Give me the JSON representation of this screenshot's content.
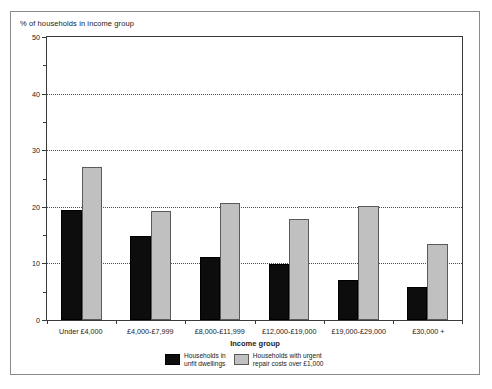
{
  "figure": {
    "title": "% of households in income group",
    "axis_title_x": "Income group"
  },
  "chart_data": {
    "type": "bar",
    "title": "% of households in income group",
    "xlabel": "Income group",
    "ylabel": "",
    "ylim": [
      0,
      50
    ],
    "yticks": [
      0,
      10,
      20,
      30,
      40,
      50
    ],
    "ytick_labels": [
      "0",
      "10",
      "20",
      "30",
      "40",
      "50"
    ],
    "yminor_ticks": [
      5,
      15,
      25,
      35,
      45
    ],
    "grid": "horizontal-dotted",
    "legend_position": "bottom",
    "categories": [
      "Under £4,000",
      "£4,000-£7,999",
      "£8,000-£11,999",
      "£12,000-£19,000",
      "£19,000-£29,000",
      "£30,000 +"
    ],
    "series": [
      {
        "name": "Households in\nunfit dwellings",
        "color": "#0d0d0d",
        "values": [
          19.4,
          14.8,
          11.2,
          9.9,
          7.1,
          5.9
        ]
      },
      {
        "name": "Households with urgent\nrepair costs over £1,000",
        "color": "#c0c0c0",
        "values": [
          27.0,
          19.3,
          20.7,
          17.9,
          20.2,
          13.4
        ]
      }
    ]
  }
}
